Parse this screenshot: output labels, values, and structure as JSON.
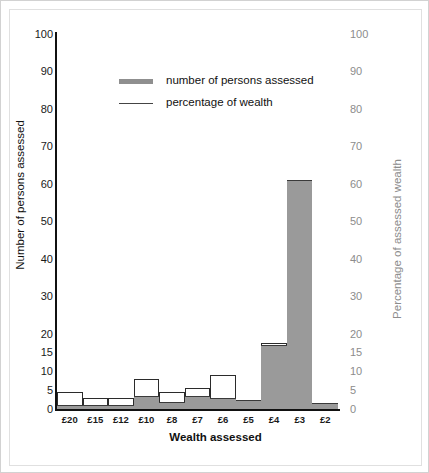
{
  "chart_data": {
    "type": "bar",
    "title": "",
    "xlabel": "Wealth assessed",
    "ylabel": "Number of persons assessed",
    "y2label": "Percentage of assessed wealth",
    "grid": false,
    "legend_position": "top-center",
    "ylim": [
      0,
      100
    ],
    "y2lim": [
      0,
      100
    ],
    "yticks": [
      "0",
      "5",
      "10",
      "15",
      "20",
      "30",
      "40",
      "50",
      "60",
      "70",
      "80",
      "90",
      "100"
    ],
    "ytick_values": [
      0,
      5,
      10,
      15,
      20,
      30,
      40,
      50,
      60,
      70,
      80,
      90,
      100
    ],
    "y2ticks": [
      "0",
      "5",
      "10",
      "15",
      "20",
      "30",
      "40",
      "50",
      "60",
      "70",
      "80",
      "90",
      "100"
    ],
    "y2tick_values": [
      0,
      5,
      10,
      15,
      20,
      30,
      40,
      50,
      60,
      70,
      80,
      90,
      100
    ],
    "categories": [
      "£20",
      "£15",
      "£12",
      "£10",
      "£8",
      "£7",
      "£6",
      "£5",
      "£4",
      "£3",
      "£2"
    ],
    "series": [
      {
        "name": "number of persons assessed",
        "axis": "left",
        "style": "filled-bar",
        "color": "#9a9a9a",
        "values": [
          1,
          1,
          1,
          3.5,
          2,
          3.5,
          3,
          2.5,
          17,
          61,
          1.5
        ]
      },
      {
        "name": "percentage of wealth",
        "axis": "right",
        "style": "outline-step",
        "color": "#2b2b2b",
        "values": [
          4.5,
          3,
          3,
          8,
          4.5,
          5.5,
          9,
          2.5,
          17.5,
          42,
          1.5
        ]
      }
    ]
  },
  "legend": {
    "items": [
      {
        "label": "number of persons assessed",
        "swatch": "thick-gray-line"
      },
      {
        "label": "percentage of wealth",
        "swatch": "thin-black-line"
      }
    ]
  },
  "colors": {
    "bar_fill": "#9a9a9a",
    "outline": "#2b2b2b",
    "left_axis_text": "#1a1a1a",
    "right_axis_text": "#8c8c8c",
    "frame": "#d2d2d2",
    "background": "#ffffff"
  }
}
